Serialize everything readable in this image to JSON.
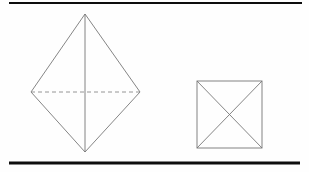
{
  "page": {
    "width": 309,
    "height": 172,
    "background_color": "#fefefe"
  },
  "colors": {
    "rule": "#0d0d0d",
    "stroke": "#777777",
    "hidden_stroke": "#8a8a8a",
    "background": "#fefefe"
  },
  "rules": {
    "top": {
      "name": "top-horizontal-rule",
      "x1": 9,
      "y1": 3,
      "x2": 302,
      "y2": 3,
      "thickness": 2
    },
    "bottom": {
      "name": "bottom-horizontal-rule",
      "x1": 9,
      "y1": 163,
      "x2": 300,
      "y2": 163,
      "thickness": 3
    }
  },
  "figures": [
    {
      "id": "pyramid-front-view",
      "label": "Square pyramid front elevation",
      "type": "rhombus-with-axes",
      "vertices": {
        "top": [
          85,
          14
        ],
        "left": [
          31,
          92
        ],
        "bottom": [
          85,
          152
        ],
        "right": [
          140,
          92
        ]
      },
      "outline_stroke_width": 0.9,
      "interior_lines": [
        {
          "name": "vertical-axis",
          "style": "solid",
          "from": [
            85,
            14
          ],
          "to": [
            85,
            152
          ]
        },
        {
          "name": "horizontal-hidden-edge",
          "style": "dashed",
          "dash": "4 3",
          "from": [
            31,
            92
          ],
          "to": [
            140,
            92
          ]
        }
      ]
    },
    {
      "id": "pyramid-top-view",
      "label": "Square pyramid plan view",
      "type": "square-with-diagonals",
      "vertices": {
        "top_left": [
          197,
          81
        ],
        "top_right": [
          262,
          81
        ],
        "bottom_right": [
          262,
          148
        ],
        "bottom_left": [
          197,
          148
        ]
      },
      "center": [
        229.5,
        114.5
      ],
      "outline_stroke_width": 0.9,
      "interior_lines": [
        {
          "name": "diagonal-tl-br",
          "style": "solid",
          "from": [
            197,
            81
          ],
          "to": [
            262,
            148
          ]
        },
        {
          "name": "diagonal-tr-bl",
          "style": "solid",
          "from": [
            262,
            81
          ],
          "to": [
            197,
            148
          ]
        }
      ]
    }
  ]
}
